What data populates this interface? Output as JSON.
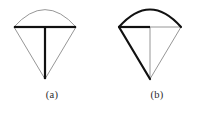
{
  "figure": {
    "background_color": "#ffffff",
    "stroke_bold_color": "#111111",
    "stroke_thin_color": "#8a8a8a",
    "caption_color": "#2b2b2b",
    "panels": [
      {
        "id": "a",
        "caption": "(a)",
        "description": "cone with canopy arc, bold horizontal chord and bold vertical axis",
        "geometry": {
          "chord_left_x": 14,
          "chord_right_x": 76,
          "chord_y": 27,
          "apex_x": 45,
          "apex_y": 79,
          "arc_peak_y": 5,
          "arc_control_y": -8
        },
        "strokes": {
          "arc": {
            "weight": "thin",
            "width": 0.9,
            "color": "#8a8a8a"
          },
          "chord_left": {
            "weight": "bold",
            "width": 2.2,
            "color": "#111111"
          },
          "chord_right": {
            "weight": "bold",
            "width": 2.2,
            "color": "#111111"
          },
          "diagonal_left": {
            "weight": "thin",
            "width": 0.9,
            "color": "#8a8a8a"
          },
          "diagonal_right": {
            "weight": "thin",
            "width": 0.9,
            "color": "#8a8a8a"
          },
          "axis": {
            "weight": "bold",
            "width": 2.2,
            "color": "#111111"
          }
        }
      },
      {
        "id": "b",
        "caption": "(b)",
        "description": "cone with bold canopy arc, bold left slant and bold left half chord",
        "geometry": {
          "chord_left_x": 14,
          "chord_right_x": 76,
          "chord_y": 27,
          "apex_x": 45,
          "apex_y": 79,
          "arc_peak_y": 5,
          "arc_control_y": -8
        },
        "strokes": {
          "arc": {
            "weight": "bold",
            "width": 2.2,
            "color": "#111111"
          },
          "chord_left": {
            "weight": "bold",
            "width": 2.2,
            "color": "#111111"
          },
          "chord_right": {
            "weight": "thin",
            "width": 0.9,
            "color": "#8a8a8a"
          },
          "diagonal_left": {
            "weight": "bold",
            "width": 2.2,
            "color": "#111111"
          },
          "diagonal_right": {
            "weight": "thin",
            "width": 0.9,
            "color": "#8a8a8a"
          },
          "axis": {
            "weight": "thin",
            "width": 0.9,
            "color": "#8a8a8a"
          }
        }
      }
    ]
  }
}
